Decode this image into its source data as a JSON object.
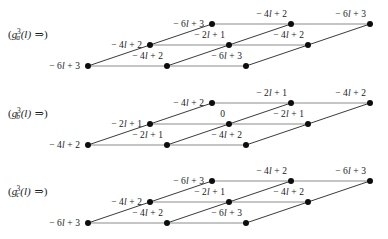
{
  "figure": {
    "type": "lattice-diagram-set",
    "background": "#ffffff",
    "node_color": "#0d0d0d",
    "horizontal_edge_color": "#8c8c8c",
    "diagonal_edge_color": "#3a3a3a",
    "geometry": {
      "origin_x": 88,
      "origin_y": 66,
      "col_step_x": 79,
      "row_step_x": 62,
      "row_step_y": -21,
      "node_radius": 3,
      "cols": 3,
      "rows": 3
    },
    "groups": [
      {
        "id": "a",
        "label": {
          "prefix": "(",
          "fn": "g",
          "sub": "a",
          "sup": "3",
          "arg": "(l)",
          "arrow": "⇒",
          "suffix": ")",
          "plain": "(g_a^3(l) ⇒)"
        },
        "rows": [
          {
            "row": 0,
            "labels": [
              "− 6l + 3",
              "− 4l + 2",
              "− 6l + 3"
            ]
          },
          {
            "row": 1,
            "labels": [
              "− 4l + 2",
              "− 2l + 1",
              "− 4l + 2"
            ]
          },
          {
            "row": 2,
            "labels": [
              "− 6l + 3",
              "− 4l + 2",
              "− 6l + 3"
            ]
          }
        ]
      },
      {
        "id": "b",
        "label": {
          "prefix": "(",
          "fn": "g",
          "sub": "b",
          "sup": "3",
          "arg": "(l)",
          "arrow": "⇒",
          "suffix": ")",
          "plain": "(g_b^3(l) ⇒)"
        },
        "rows": [
          {
            "row": 0,
            "labels": [
              "− 4l + 2",
              "− 2l + 1",
              "− 4l + 2"
            ]
          },
          {
            "row": 1,
            "labels": [
              "− 2l + 1",
              "0",
              "− 2l + 1"
            ]
          },
          {
            "row": 2,
            "labels": [
              "− 4l + 2",
              "− 2l + 1",
              "− 4l + 2"
            ]
          }
        ]
      },
      {
        "id": "c",
        "label": {
          "prefix": "(",
          "fn": "g",
          "sub": "c",
          "sup": "3",
          "arg": "(l)",
          "arrow": "⇒",
          "suffix": ")",
          "plain": "(g_c^3(l) ⇒)"
        },
        "rows": [
          {
            "row": 0,
            "labels": [
              "− 6l + 3",
              "− 4l + 2",
              "− 6l + 3"
            ]
          },
          {
            "row": 1,
            "labels": [
              "− 4l + 2",
              "− 2l + 1",
              "− 4l + 2"
            ]
          },
          {
            "row": 2,
            "labels": [
              "− 6l + 3",
              "− 4l + 2",
              "− 6l + 3"
            ]
          }
        ]
      }
    ]
  }
}
